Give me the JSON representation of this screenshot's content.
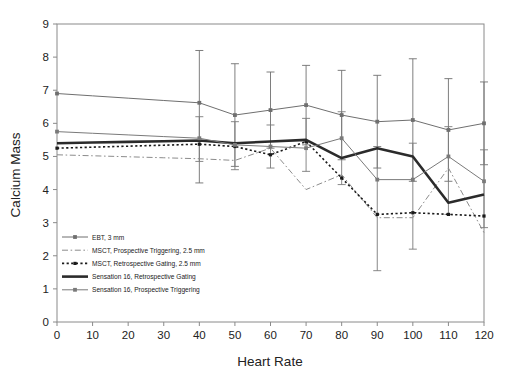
{
  "figure": {
    "title": "",
    "caption": ""
  },
  "axes": {
    "xlabel": "Heart Rate",
    "ylabel": "Calcium Mass",
    "xticks": [
      "0",
      "10",
      "20",
      "30",
      "40",
      "50",
      "60",
      "70",
      "80",
      "90",
      "100",
      "110",
      "120"
    ],
    "yticks": [
      "0",
      "1",
      "2",
      "3",
      "4",
      "5",
      "6",
      "7",
      "8",
      "9"
    ]
  },
  "legend": {
    "items": [
      {
        "label": "EBT, 3 mm",
        "style": "solid-thin-marker",
        "color": "#6f6f6f"
      },
      {
        "label": "MSCT, Prospective Triggering, 2.5 mm",
        "style": "dash-dot",
        "color": "#8c8c8c"
      },
      {
        "label": "MSCT, Retrospective Gating, 2.5 mm",
        "style": "dotted-square",
        "color": "#1a1a1a"
      },
      {
        "label": "Sensation 16, Retrospective Gating",
        "style": "solid-thick",
        "color": "#2b2b2b"
      },
      {
        "label": "Sensation 16, Prospective Triggering",
        "style": "solid-thin-marker",
        "color": "#7a7a7a"
      }
    ]
  },
  "chart_data": {
    "type": "line",
    "title": "",
    "xlabel": "Heart Rate",
    "ylabel": "Calcium Mass",
    "xlim": [
      0,
      120
    ],
    "ylim": [
      0,
      9
    ],
    "xticks": [
      0,
      10,
      20,
      30,
      40,
      50,
      60,
      70,
      80,
      90,
      100,
      110,
      120
    ],
    "yticks": [
      0,
      1,
      2,
      3,
      4,
      5,
      6,
      7,
      8,
      9
    ],
    "grid": false,
    "legend_position": "lower-left-inside",
    "x": [
      0,
      10,
      20,
      30,
      40,
      50,
      60,
      70,
      80,
      90,
      100,
      110,
      120
    ],
    "series": [
      {
        "name": "EBT, 3 mm",
        "color": "#6f6f6f",
        "linestyle": "solid",
        "linewidth": 1.0,
        "marker": "square",
        "values": [
          6.9,
          6.83,
          6.76,
          6.69,
          6.62,
          6.25,
          6.4,
          6.55,
          6.25,
          6.05,
          6.1,
          5.8,
          6.0
        ],
        "errorbars": {
          "x": [
            40,
            50,
            60,
            70,
            80,
            90,
            100,
            110,
            120
          ],
          "upper": [
            8.2,
            7.8,
            7.55,
            7.75,
            7.6,
            7.45,
            7.95,
            7.35,
            7.25
          ],
          "lower": [
            4.2,
            4.7,
            5.25,
            5.35,
            4.9,
            4.65,
            4.25,
            4.25,
            4.75
          ]
        }
      },
      {
        "name": "MSCT, Prospective Triggering, 2.5 mm",
        "color": "#8c8c8c",
        "linestyle": "dash-dot",
        "linewidth": 1.0,
        "marker": "none",
        "values": [
          5.05,
          5.02,
          4.99,
          4.96,
          4.93,
          4.88,
          5.25,
          4.0,
          4.45,
          3.15,
          3.15,
          4.65,
          2.7
        ]
      },
      {
        "name": "MSCT, Retrospective Gating, 2.5 mm",
        "color": "#1a1a1a",
        "linestyle": "dotted",
        "linewidth": 1.6,
        "marker": "square-small",
        "values": [
          5.25,
          5.28,
          5.31,
          5.34,
          5.37,
          5.3,
          5.05,
          5.45,
          4.35,
          3.25,
          3.3,
          3.25,
          3.2
        ]
      },
      {
        "name": "Sensation 16, Retrospective Gating",
        "color": "#2b2b2b",
        "linestyle": "solid",
        "linewidth": 2.6,
        "marker": "none",
        "values": [
          5.4,
          5.42,
          5.44,
          5.46,
          5.48,
          5.4,
          5.45,
          5.5,
          4.95,
          5.25,
          5.0,
          3.6,
          3.85
        ]
      },
      {
        "name": "Sensation 16, Prospective Triggering",
        "color": "#7a7a7a",
        "linestyle": "solid",
        "linewidth": 1.0,
        "marker": "square",
        "values": [
          5.75,
          5.7,
          5.65,
          5.6,
          5.55,
          5.35,
          5.3,
          5.25,
          5.55,
          4.3,
          4.3,
          5.0,
          4.25
        ],
        "errorbars": {
          "x": [
            40,
            50,
            60,
            70,
            80,
            90,
            100,
            110,
            120
          ],
          "upper": [
            6.2,
            6.05,
            5.95,
            6.15,
            6.35,
            5.3,
            5.4,
            5.9,
            5.2
          ],
          "lower": [
            4.85,
            4.6,
            4.65,
            4.55,
            4.15,
            1.55,
            2.2,
            3.25,
            2.85
          ]
        }
      }
    ]
  }
}
